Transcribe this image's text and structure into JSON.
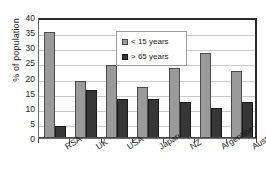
{
  "chart_data": {
    "type": "bar",
    "title": "",
    "xlabel": "",
    "ylabel": "% of population",
    "ylim": [
      0,
      40
    ],
    "ytick_step": 5,
    "yticks": [
      "40",
      "35",
      "30",
      "25",
      "20",
      "15",
      "10",
      "5",
      "0"
    ],
    "grid": true,
    "legend_position": "upper-center",
    "categories": [
      "RSA",
      "UK",
      "USA",
      "Japan",
      "NZ",
      "Argentine",
      "Australia"
    ],
    "series": [
      {
        "name": "< 15 years",
        "color": "#9a9a9a",
        "values": [
          35,
          19,
          24,
          17,
          23,
          28,
          22
        ]
      },
      {
        "name": "> 65 years",
        "color": "#363636",
        "values": [
          4,
          16,
          13,
          13,
          12,
          10,
          12
        ]
      }
    ]
  },
  "legend": {
    "items": [
      {
        "label": "< 15 years",
        "swatch": "legend-swatch-young"
      },
      {
        "label": "> 65 years",
        "swatch": "legend-swatch-old"
      }
    ]
  },
  "axes": {
    "y_title": "% of population"
  },
  "colors": {
    "series_young": "#9a9a9a",
    "series_old": "#363636",
    "gridline": "#c9c9c9",
    "frame": "#2b2b2b",
    "text": "#1c1c1c",
    "background": "#ffffff"
  }
}
